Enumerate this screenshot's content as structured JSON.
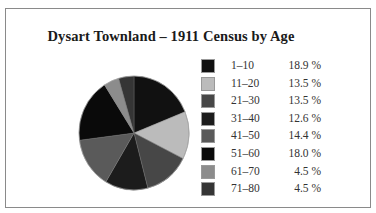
{
  "chart_data": {
    "type": "pie",
    "title": "Dysart Townland – 1911 Census by Age",
    "categories": [
      "1–10",
      "11–20",
      "21–30",
      "31–40",
      "41–50",
      "51–60",
      "61–70",
      "71–80"
    ],
    "values": [
      18.9,
      13.5,
      13.5,
      12.6,
      14.4,
      18.0,
      4.5,
      4.5
    ],
    "value_labels": [
      "18.9 %",
      "13.5 %",
      "13.5 %",
      "12.6 %",
      "14.4 %",
      "18.0 %",
      "4.5 %",
      "4.5 %"
    ],
    "colors": [
      "#111111",
      "#bbbbbb",
      "#474747",
      "#1c1c1c",
      "#5a5a5a",
      "#0a0a0a",
      "#8c8c8c",
      "#353535"
    ],
    "start_angle": "12 o'clock",
    "direction": "clockwise",
    "legend_position": "right",
    "xlabel": "",
    "ylabel": ""
  }
}
